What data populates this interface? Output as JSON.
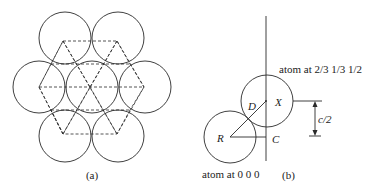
{
  "figure_a": {
    "caption": "(a)",
    "circles": [
      {
        "cx": 65,
        "cy": 38
      },
      {
        "cx": 118,
        "cy": 38
      },
      {
        "cx": 39,
        "cy": 87
      },
      {
        "cx": 92,
        "cy": 87
      },
      {
        "cx": 145,
        "cy": 87
      },
      {
        "cx": 65,
        "cy": 136
      },
      {
        "cx": 118,
        "cy": 136
      }
    ],
    "radius": 26
  },
  "figure_b": {
    "caption": "(b)",
    "atom_upper_label": "atom at 2/3 1/3 1/2",
    "atom_lower_label": "atom at 0 0 0",
    "point_labels": {
      "D": "D",
      "X": "X",
      "R": "R",
      "C": "C"
    },
    "dimension_label": "c/2"
  },
  "colors": {
    "stroke": "#2a2a2a",
    "background": "#ffffff"
  }
}
